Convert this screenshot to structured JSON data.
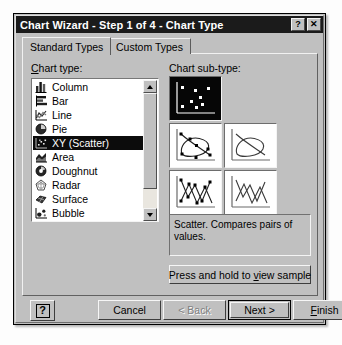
{
  "window": {
    "title": "Chart Wizard - Step 1 of 4 - Chart Type",
    "help_button": "?",
    "close_button": "✕"
  },
  "tabs": [
    {
      "label": "Standard Types",
      "active": true
    },
    {
      "label": "Custom Types",
      "active": false
    }
  ],
  "chart_type": {
    "label": "Chart type:",
    "label_accel": "C",
    "items": [
      {
        "label": "Column",
        "icon": "column-chart-icon",
        "selected": false
      },
      {
        "label": "Bar",
        "icon": "bar-chart-icon",
        "selected": false
      },
      {
        "label": "Line",
        "icon": "line-chart-icon",
        "selected": false
      },
      {
        "label": "Pie",
        "icon": "pie-chart-icon",
        "selected": false
      },
      {
        "label": "XY (Scatter)",
        "icon": "scatter-chart-icon",
        "selected": true
      },
      {
        "label": "Area",
        "icon": "area-chart-icon",
        "selected": false
      },
      {
        "label": "Doughnut",
        "icon": "doughnut-chart-icon",
        "selected": false
      },
      {
        "label": "Radar",
        "icon": "radar-chart-icon",
        "selected": false
      },
      {
        "label": "Surface",
        "icon": "surface-chart-icon",
        "selected": false
      },
      {
        "label": "Bubble",
        "icon": "bubble-chart-icon",
        "selected": false
      },
      {
        "label": "Stock",
        "icon": "stock-chart-icon",
        "selected": false
      }
    ],
    "scroll_up": "▲",
    "scroll_down": "▼"
  },
  "sub_type": {
    "label": "Chart sub-type:",
    "cells": [
      {
        "name": "scatter-points-only",
        "selected": true
      },
      {
        "name": "scatter-smooth-lines-with-markers",
        "selected": false
      },
      {
        "name": "scatter-smooth-lines-no-markers",
        "selected": false
      },
      {
        "name": "scatter-straight-lines-with-markers",
        "selected": false
      },
      {
        "name": "scatter-straight-lines-no-markers",
        "selected": false
      }
    ]
  },
  "description": "Scatter. Compares pairs of values.",
  "sample_button": {
    "pre": "Press and hold to ",
    "accel": "v",
    "post": "iew sample"
  },
  "buttons": {
    "help": "?",
    "cancel": "Cancel",
    "back": "< Back",
    "next": "Next >",
    "finish_pre": "",
    "finish_accel": "F",
    "finish_post": "inish"
  },
  "colors": {
    "face": "#c0c0c0",
    "titlebar": "#1b1b1b",
    "selection": "#0c0c0c",
    "selection_text": "#ffffff",
    "listbox_bg": "#ffffff"
  }
}
